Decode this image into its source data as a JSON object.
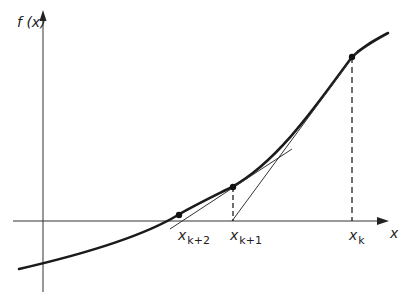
{
  "diagram": {
    "y_axis_label": "f (x)",
    "x_axis_label": "x",
    "points": [
      {
        "base": "x",
        "sub": "k+2"
      },
      {
        "base": "x",
        "sub": "k+1"
      },
      {
        "base": "x",
        "sub": "k"
      }
    ],
    "colors": {
      "ink": "#222222",
      "background": "#ffffff"
    }
  }
}
